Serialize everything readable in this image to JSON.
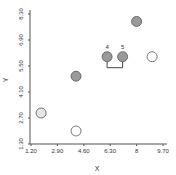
{
  "chart_data": {
    "type": "scatter",
    "title": "",
    "xlabel": "X",
    "ylabel": "Y",
    "xlim": [
      1.2,
      9.7
    ],
    "ylim": [
      1.3,
      8.3
    ],
    "x_ticks": [
      "1.20",
      "2.90",
      "4.60",
      "6.30",
      "8",
      "9.70"
    ],
    "x_tick_values": [
      1.2,
      2.9,
      4.6,
      6.3,
      8.0,
      9.7
    ],
    "y_ticks": [
      "1.30",
      "2.70",
      "4.10",
      "5.50",
      "6.90",
      "8.30"
    ],
    "y_tick_values": [
      1.3,
      2.7,
      4.1,
      5.5,
      6.9,
      8.3
    ],
    "grid": false,
    "legend": null,
    "points": [
      {
        "x": 1.85,
        "y": 2.97,
        "fill": "light",
        "label": ""
      },
      {
        "x": 4.1,
        "y": 2.0,
        "fill": "white",
        "label": ""
      },
      {
        "x": 4.1,
        "y": 4.95,
        "fill": "gray",
        "label": ""
      },
      {
        "x": 6.1,
        "y": 6.0,
        "fill": "gray",
        "label": "4"
      },
      {
        "x": 7.1,
        "y": 6.0,
        "fill": "gray",
        "label": "5"
      },
      {
        "x": 8.0,
        "y": 7.9,
        "fill": "gray",
        "label": ""
      },
      {
        "x": 9.0,
        "y": 6.0,
        "fill": "white",
        "label": ""
      }
    ],
    "annotations": [
      {
        "type": "bracket",
        "connects": [
          "4",
          "5"
        ]
      }
    ],
    "colors": {
      "gray": "#9a9a9a",
      "white": "#ffffff",
      "light": "#e6e6e6",
      "stroke": "#555555",
      "axis": "#555555"
    }
  }
}
